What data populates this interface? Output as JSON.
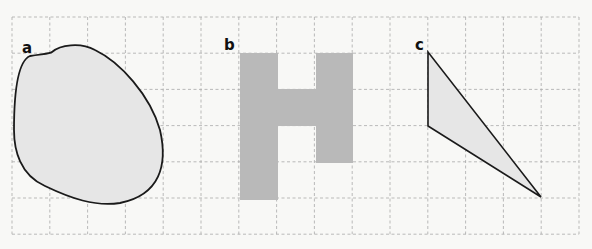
{
  "grid": {
    "x0": 12,
    "y0": 17,
    "cell_w": 37.8,
    "cell_h": 36.2,
    "cols": 15,
    "rows": 6,
    "line_color": "#aaaaaa"
  },
  "colors": {
    "background": "#f8f8f6",
    "shape_fill_light": "#e6e6e6",
    "shape_fill_h": "#b9b9b9",
    "outline": "#1a1a1a"
  },
  "shapes": [
    {
      "label": "a",
      "type": "irregular-blob",
      "label_x": 22,
      "label_y": 53
    },
    {
      "label": "b",
      "type": "H-shape",
      "label_x": 224,
      "label_y": 50
    },
    {
      "label": "c",
      "type": "triangle",
      "label_x": 415,
      "label_y": 50,
      "vertices": [
        [
          428,
          52
        ],
        [
          428,
          126
        ],
        [
          541,
          197
        ]
      ]
    }
  ]
}
